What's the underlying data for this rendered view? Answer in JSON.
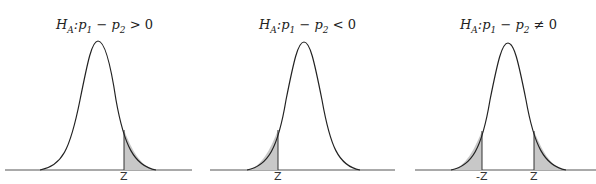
{
  "panels": [
    {
      "title": {
        "H": "H",
        "Hsub": "A",
        "p1": "p",
        "p1sub": "1",
        "op_minus": " − ",
        "p2": "p",
        "p2sub": "2",
        "relation": " > 0",
        "prefix_colon": ":"
      },
      "tail": "right",
      "labels": [
        "Z"
      ]
    },
    {
      "title": {
        "H": "H",
        "Hsub": "A",
        "p1": "p",
        "p1sub": "1",
        "op_minus": " − ",
        "p2": "p",
        "p2sub": "2",
        "relation": " < 0",
        "prefix_colon": ":"
      },
      "tail": "left",
      "labels": [
        "Z"
      ]
    },
    {
      "title": {
        "H": "H",
        "Hsub": "A",
        "p1": "p",
        "p1sub": "1",
        "op_minus": " − ",
        "p2": "p",
        "p2sub": "2",
        "relation": " ≠ 0",
        "prefix_colon": ":"
      },
      "tail": "two-sided",
      "labels": [
        "-Z",
        "Z"
      ]
    }
  ],
  "colors": {
    "curve": "#222222",
    "shade": "#c8c8c8",
    "axis": "#555555"
  }
}
